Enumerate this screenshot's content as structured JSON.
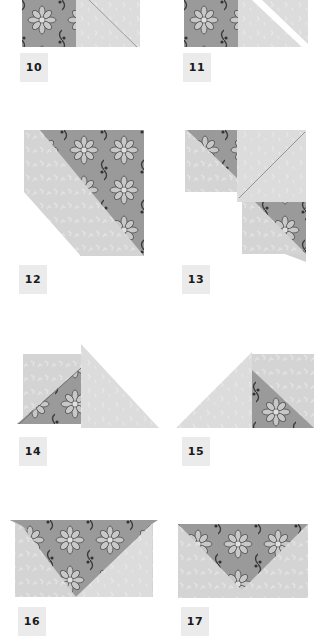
{
  "page": {
    "type": "paper-folding instructions",
    "colors": {
      "background": "#ffffff",
      "label_box": "#ebebeb",
      "label_text": "#1a1a1a",
      "plain_paper": "#d4d4d4",
      "plain_paper_light": "#dedede",
      "pattern_paper": "#9a9a9a",
      "pattern_dark": "#4a4a4a",
      "pattern_light": "#c8c8c8",
      "crease": "#8a8a8a"
    }
  },
  "steps": [
    {
      "number": "10",
      "label": "10"
    },
    {
      "number": "11",
      "label": "11"
    },
    {
      "number": "12",
      "label": "12"
    },
    {
      "number": "13",
      "label": "13"
    },
    {
      "number": "14",
      "label": "14"
    },
    {
      "number": "15",
      "label": "15"
    },
    {
      "number": "16",
      "label": "16"
    },
    {
      "number": "17",
      "label": "17"
    }
  ]
}
